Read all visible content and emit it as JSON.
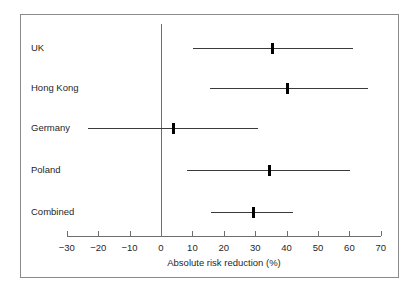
{
  "chart_data": {
    "type": "scatter",
    "plot_kind": "forest-plot",
    "title": "",
    "xlabel": "Absolute risk reduction (%)",
    "ylabel": "",
    "xlim": [
      -30,
      70
    ],
    "xticks": [
      -30,
      -20,
      -10,
      0,
      10,
      20,
      30,
      40,
      50,
      60,
      70
    ],
    "xtick_labels": [
      "−30",
      "−20",
      "−10",
      "0",
      "10",
      "20",
      "30",
      "40",
      "50",
      "60",
      "70"
    ],
    "grid": false,
    "legend": null,
    "reference_line": 0,
    "categories": [
      "UK",
      "Hong Kong",
      "Germany",
      "Poland",
      "Combined"
    ],
    "values": [
      35.4,
      40.4,
      4.1,
      34.7,
      29.4
    ],
    "ci_low": [
      10.2,
      15.6,
      -23.2,
      8.3,
      15.9
    ],
    "ci_high": [
      61.1,
      65.9,
      30.9,
      60.2,
      42.1
    ],
    "rows": [
      {
        "label": "UK",
        "estimate": 35.4,
        "low": 10.2,
        "high": 61.1
      },
      {
        "label": "Hong Kong",
        "estimate": 40.4,
        "low": 15.6,
        "high": 65.9
      },
      {
        "label": "Germany",
        "estimate": 4.1,
        "low": -23.2,
        "high": 30.9
      },
      {
        "label": "Poland",
        "estimate": 34.7,
        "low": 8.3,
        "high": 60.2
      },
      {
        "label": "Combined",
        "estimate": 29.4,
        "low": 15.9,
        "high": 42.1
      }
    ],
    "colors": {
      "marker": "#000000",
      "ci_line": "#3a3a3a",
      "axis": "#6e6e6e",
      "frame": "#8a8a8a",
      "background": "#ffffff",
      "text": "#1f1f1f"
    }
  },
  "layout": {
    "axis_y": 236,
    "axis_x_left": 67,
    "axis_x_right": 381,
    "px_per_unit": 3.14,
    "zero_x": 161,
    "zero_line_top": 24,
    "row_y": [
      40,
      80,
      120,
      162,
      204
    ]
  }
}
